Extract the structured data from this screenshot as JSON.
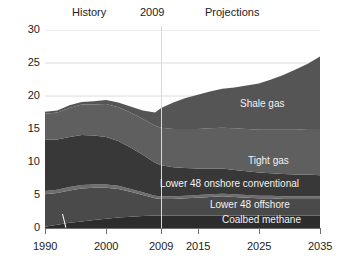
{
  "header": {
    "history_label": "History",
    "year_marker": "2009",
    "projections_label": "Projections"
  },
  "chart_data": {
    "type": "area",
    "stacked": true,
    "title": "",
    "xlabel": "",
    "ylabel": "",
    "xlim": [
      1990,
      2035
    ],
    "ylim": [
      0,
      30
    ],
    "grid": true,
    "legend_position": "inline-annotations",
    "ytick_labels": [
      "0",
      "5",
      "10",
      "15",
      "20",
      "25",
      "30"
    ],
    "ytick_values": [
      0,
      5,
      10,
      15,
      20,
      25,
      30
    ],
    "xtick_labels": [
      "1990",
      "2000",
      "2009",
      "2015",
      "2025",
      "2035"
    ],
    "xtick_values": [
      1990,
      2000,
      2009,
      2015,
      2025,
      2035
    ],
    "x": [
      1990,
      1992,
      1994,
      1996,
      1998,
      2000,
      2002,
      2004,
      2006,
      2008,
      2009,
      2011,
      2013,
      2015,
      2017,
      2019,
      2021,
      2023,
      2025,
      2027,
      2029,
      2031,
      2033,
      2035
    ],
    "series": [
      {
        "name": "Coalbed methane",
        "color": "#2c2c2c",
        "values": [
          0.2,
          0.5,
          0.8,
          1.0,
          1.2,
          1.4,
          1.6,
          1.7,
          1.8,
          1.9,
          1.9,
          1.9,
          1.9,
          1.9,
          1.9,
          1.9,
          1.9,
          1.9,
          1.9,
          1.9,
          1.9,
          1.9,
          1.9,
          1.9
        ]
      },
      {
        "name": "Lower 48 offshore",
        "color": "#4a4a4a",
        "values": [
          4.9,
          4.8,
          4.9,
          5.0,
          4.9,
          4.7,
          4.3,
          3.8,
          3.2,
          2.6,
          2.5,
          2.5,
          2.6,
          2.7,
          2.8,
          2.9,
          2.8,
          2.7,
          2.6,
          2.6,
          2.5,
          2.5,
          2.5,
          2.5
        ]
      },
      {
        "name": "Alaska",
        "color": "#6e6e6e",
        "values": [
          0.5,
          0.5,
          0.5,
          0.5,
          0.5,
          0.5,
          0.5,
          0.4,
          0.4,
          0.4,
          0.4,
          0.4,
          0.4,
          0.4,
          0.4,
          0.4,
          0.4,
          0.4,
          0.4,
          0.4,
          0.4,
          0.4,
          0.4,
          0.4
        ]
      },
      {
        "name": "Lower 48 onshore conventional",
        "color": "#383838",
        "values": [
          7.8,
          7.6,
          7.6,
          7.6,
          7.4,
          7.2,
          6.8,
          6.3,
          5.7,
          5.0,
          4.7,
          4.4,
          4.2,
          4.0,
          3.9,
          3.8,
          3.7,
          3.6,
          3.5,
          3.4,
          3.4,
          3.3,
          3.3,
          3.2
        ]
      },
      {
        "name": "Tight gas",
        "color": "#5f5f5f",
        "values": [
          3.9,
          4.1,
          4.4,
          4.6,
          4.7,
          5.0,
          5.1,
          5.3,
          5.4,
          5.6,
          5.7,
          5.8,
          5.9,
          6.0,
          6.1,
          6.2,
          6.3,
          6.4,
          6.5,
          6.6,
          6.7,
          6.8,
          6.9,
          7.0
        ]
      },
      {
        "name": "Shale gas",
        "color": "#555555",
        "values": [
          0.3,
          0.3,
          0.4,
          0.4,
          0.5,
          0.6,
          0.7,
          0.9,
          1.3,
          2.0,
          3.0,
          4.0,
          4.7,
          5.2,
          5.6,
          5.9,
          6.2,
          6.6,
          7.0,
          7.6,
          8.3,
          9.1,
          9.9,
          11.0
        ]
      }
    ],
    "annotations": [
      {
        "text": "Shale gas",
        "series": "Shale gas"
      },
      {
        "text": "Tight gas",
        "series": "Tight gas"
      },
      {
        "text": "Lower 48 onshore conventional",
        "series": "Lower 48 onshore conventional"
      },
      {
        "text": "Lower 48 offshore",
        "series": "Lower 48 offshore"
      },
      {
        "text": "Coalbed methane",
        "series": "Coalbed methane"
      },
      {
        "text": "Alaska",
        "series": "Alaska"
      }
    ],
    "marker_line": {
      "x": 2009,
      "label": "2009"
    }
  }
}
